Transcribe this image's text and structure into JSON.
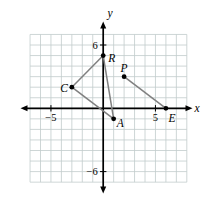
{
  "chart_data": {
    "type": "scatter",
    "axis": {
      "xlabel": "x",
      "ylabel": "y",
      "grid": true,
      "grid_x_range": [
        -7,
        8
      ],
      "grid_y_range": [
        -7,
        7
      ],
      "x_ticks": [
        {
          "value": -5,
          "label": "−5"
        },
        {
          "value": 5,
          "label": "5"
        }
      ],
      "y_ticks": [
        {
          "value": 6,
          "label": "6"
        },
        {
          "value": -6,
          "label": "−6"
        }
      ]
    },
    "points": [
      {
        "name": "R",
        "x": 0,
        "y": 5
      },
      {
        "name": "C",
        "x": -3,
        "y": 2
      },
      {
        "name": "A",
        "x": 1,
        "y": -1
      },
      {
        "name": "P",
        "x": 2,
        "y": 3
      },
      {
        "name": "E",
        "x": 6,
        "y": 0
      }
    ],
    "segments": [
      {
        "from": "C",
        "to": "R"
      },
      {
        "from": "R",
        "to": "A"
      },
      {
        "from": "C",
        "to": "A"
      },
      {
        "from": "P",
        "to": "E"
      }
    ],
    "colors": {
      "background": "#ffffff",
      "grid": "#c2cbcb",
      "axis": "#000000",
      "segment": "#808080",
      "point": "#000000",
      "label": "#000000"
    }
  }
}
